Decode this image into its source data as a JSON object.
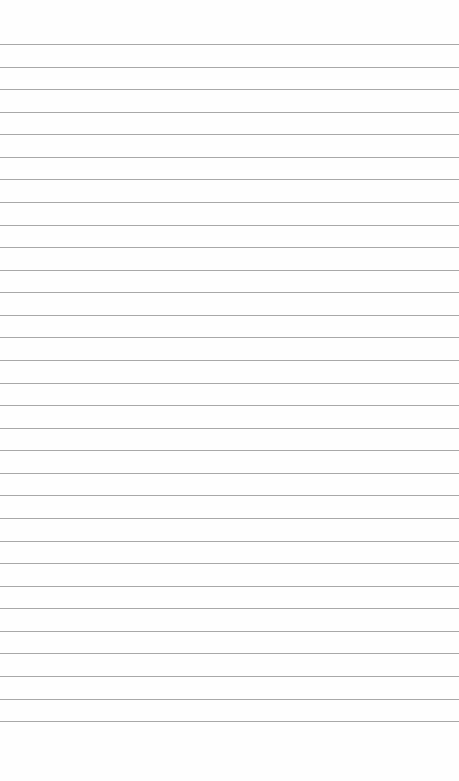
{
  "page": {
    "background": "#fefefe",
    "rule_color": "#a8a8a8",
    "first_rule_y": 44,
    "rule_spacing": 22.57,
    "rule_count": 31
  }
}
